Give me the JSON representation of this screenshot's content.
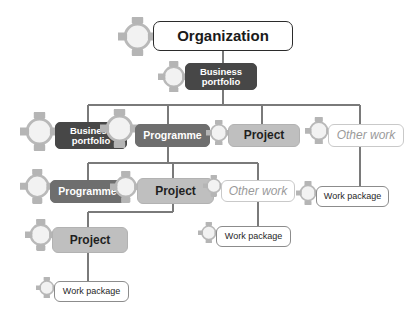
{
  "diagram": {
    "background_color": "#ffffff",
    "connector_color": "#7a7a7a",
    "icon_name": "cycle-icon",
    "levels": [
      "Organization",
      "Business portfolio",
      "Programme / Project / Other work",
      "Work package"
    ]
  },
  "palette": {
    "organization_fill": "#ffffff",
    "organization_border": "#2b2b2b",
    "portfolio_fill": "#474747",
    "programme_fill": "#6e6e6e",
    "project_fill": "#bfbfbf",
    "otherwork_fill": "#ffffff",
    "otherwork_text": "#9a9a9a",
    "workpackage_fill": "#ffffff",
    "line_color": "#7a7a7a"
  },
  "nodes": [
    {
      "id": "organization",
      "label": "Organization",
      "type": "organization",
      "variant": "v-organization",
      "x": 153,
      "y": 21,
      "w": 140,
      "h": 30,
      "icon_scale": 1.3,
      "icon_dx": -35,
      "icon_dy": 0
    },
    {
      "id": "portfolio_top",
      "label": "Business\nportfolio",
      "type": "portfolio",
      "variant": "v-portfolio",
      "x": 185,
      "y": 63,
      "w": 72,
      "h": 27,
      "icon_scale": 1.05,
      "icon_dx": -27,
      "icon_dy": 0
    },
    {
      "id": "portfolio_r2",
      "label": "Business\nportfolio",
      "type": "portfolio",
      "variant": "v-portfolio",
      "x": 55,
      "y": 122,
      "w": 72,
      "h": 27,
      "icon_scale": 1.3,
      "icon_dx": -35,
      "icon_dy": -4
    },
    {
      "id": "programme_r2",
      "label": "Programme",
      "type": "programme",
      "variant": "v-programme",
      "x": 135,
      "y": 124,
      "w": 75,
      "h": 23,
      "icon_scale": 1.3,
      "icon_dx": -35,
      "icon_dy": -7
    },
    {
      "id": "project_r2",
      "label": "Project",
      "type": "project",
      "variant": "v-project",
      "x": 228,
      "y": 124,
      "w": 72,
      "h": 23,
      "icon_scale": 0.85,
      "icon_dx": -22,
      "icon_dy": -3
    },
    {
      "id": "otherwork_r2",
      "label": "Other work",
      "type": "otherwork",
      "variant": "v-otherwork",
      "x": 328,
      "y": 124,
      "w": 76,
      "h": 23,
      "icon_scale": 0.92,
      "icon_dx": -23,
      "icon_dy": -5
    },
    {
      "id": "programme_r3",
      "label": "Programme",
      "type": "programme",
      "variant": "v-programme",
      "x": 50,
      "y": 180,
      "w": 75,
      "h": 23,
      "icon_scale": 1.15,
      "icon_dx": -30,
      "icon_dy": -5
    },
    {
      "id": "project_r3",
      "label": "Project",
      "type": "project",
      "variant": "v-project",
      "x": 137,
      "y": 178,
      "w": 77,
      "h": 26,
      "icon_scale": 1.05,
      "icon_dx": -27,
      "icon_dy": -4
    },
    {
      "id": "otherwork_r3",
      "label": "Other work",
      "type": "otherwork",
      "variant": "v-otherwork",
      "x": 221,
      "y": 180,
      "w": 74,
      "h": 22,
      "icon_scale": 0.72,
      "icon_dx": -18,
      "icon_dy": -5
    },
    {
      "id": "workpackage_r3",
      "label": "Work package",
      "type": "workpackage",
      "variant": "v-workpackage",
      "x": 316,
      "y": 186,
      "w": 73,
      "h": 21,
      "icon_scale": 0.8,
      "icon_dx": -20,
      "icon_dy": -4
    },
    {
      "id": "project_r4",
      "label": "Project",
      "type": "project",
      "variant": "v-project",
      "x": 52,
      "y": 227,
      "w": 76,
      "h": 26,
      "icon_scale": 1.05,
      "icon_dx": -27,
      "icon_dy": -5
    },
    {
      "id": "workpackage_r4",
      "label": "Work package",
      "type": "workpackage",
      "variant": "v-workpackage",
      "x": 216,
      "y": 226,
      "w": 75,
      "h": 21,
      "icon_scale": 0.72,
      "icon_dx": -18,
      "icon_dy": -4
    },
    {
      "id": "workpackage_r5",
      "label": "Work package",
      "type": "workpackage",
      "variant": "v-workpackage",
      "x": 54,
      "y": 281,
      "w": 75,
      "h": 21,
      "icon_scale": 0.72,
      "icon_dx": -18,
      "icon_dy": -4
    }
  ],
  "connectors": [
    {
      "id": "org-to-portfolio",
      "d": "M 223 51 L 223 63"
    },
    {
      "id": "portfolio-to-bus",
      "d": "M 223 90 L 223 105"
    },
    {
      "id": "bus-row2",
      "d": "M 88 105 L 360 105"
    },
    {
      "id": "bus-row2-drop-portfolio",
      "d": "M 88 105 L 88 122"
    },
    {
      "id": "bus-row2-drop-programme",
      "d": "M 168 105 L 168 124"
    },
    {
      "id": "bus-row2-drop-project",
      "d": "M 262 105 L 262 124"
    },
    {
      "id": "bus-row2-drop-otherwork",
      "d": "M 360 105 L 360 124"
    },
    {
      "id": "programme-r2-to-bus",
      "d": "M 168 147 L 168 163"
    },
    {
      "id": "bus-row3",
      "d": "M 88 163 L 258 163"
    },
    {
      "id": "bus-row3-drop-programme",
      "d": "M 88 163 L 88 180"
    },
    {
      "id": "bus-row3-drop-project",
      "d": "M 173 163 L 173 178"
    },
    {
      "id": "bus-row3-drop-otherwork",
      "d": "M 258 163 L 258 180"
    },
    {
      "id": "otherwork-r2-to-wp",
      "d": "M 360 147 L 360 186"
    },
    {
      "id": "project-r3-to-bus",
      "d": "M 173 204 L 173 212"
    },
    {
      "id": "bus-row4",
      "d": "M 88 212 L 173 212"
    },
    {
      "id": "bus-row4-drop-project",
      "d": "M 88 212 L 88 227"
    },
    {
      "id": "otherwork-r3-to-wp",
      "d": "M 258 202 L 258 226"
    },
    {
      "id": "project-r4-to-wp",
      "d": "M 88 253 L 88 281"
    }
  ]
}
